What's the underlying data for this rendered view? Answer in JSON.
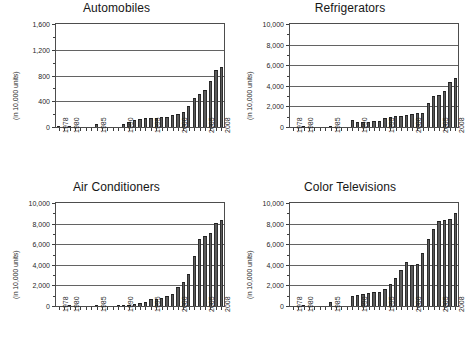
{
  "figure": {
    "panel_count": 4,
    "units_caption": "(in 10,000 units)"
  },
  "chart_data": [
    {
      "type": "bar",
      "title": "Automobiles",
      "xlabel": "",
      "ylabel": "(in 10,000 units)",
      "ylim": [
        0,
        1600
      ],
      "yticks": [
        0,
        400,
        800,
        1200,
        1600
      ],
      "ytick_labels": [
        "0",
        "400",
        "800",
        "1,200",
        "1,600"
      ],
      "grid": true,
      "legend": "none",
      "x": [
        1978,
        1979,
        1980,
        1981,
        1982,
        1983,
        1984,
        1985,
        1986,
        1987,
        1988,
        1989,
        1990,
        1991,
        1992,
        1993,
        1994,
        1995,
        1996,
        1997,
        1998,
        1999,
        2000,
        2001,
        2002,
        2003,
        2004,
        2005,
        2006,
        2007,
        2008
      ],
      "xtick_labels": [
        "1978",
        "1980",
        "1985",
        "1990",
        "1995",
        "2000",
        "2005",
        "2008"
      ],
      "categories": [
        "1978",
        "1979",
        "1980",
        "1981",
        "1982",
        "1983",
        "1984",
        "1985",
        "1986",
        "1987",
        "1988",
        "1989",
        "1990",
        "1991",
        "1992",
        "1993",
        "1994",
        "1995",
        "1996",
        "1997",
        "1998",
        "1999",
        "2000",
        "2001",
        "2002",
        "2003",
        "2004",
        "2005",
        "2006",
        "2007",
        "2008"
      ],
      "values": [
        15,
        0,
        22,
        0,
        0,
        0,
        0,
        44,
        0,
        0,
        0,
        0,
        51,
        71,
        106,
        130,
        137,
        145,
        147,
        158,
        163,
        183,
        207,
        234,
        325,
        444,
        507,
        571,
        718,
        888,
        938
      ]
    },
    {
      "type": "bar",
      "title": "Refrigerators",
      "xlabel": "",
      "ylabel": "(in 10,000 units)",
      "ylim": [
        0,
        10000
      ],
      "yticks": [
        0,
        2000,
        4000,
        6000,
        8000,
        10000
      ],
      "ytick_labels": [
        "0",
        "2,000",
        "4,000",
        "6,000",
        "8,000",
        "10,000"
      ],
      "grid": true,
      "legend": "none",
      "x": [
        1978,
        1979,
        1980,
        1981,
        1982,
        1983,
        1984,
        1985,
        1986,
        1987,
        1988,
        1989,
        1990,
        1991,
        1992,
        1993,
        1994,
        1995,
        1996,
        1997,
        1998,
        1999,
        2000,
        2001,
        2002,
        2003,
        2004,
        2005,
        2006,
        2007,
        2008
      ],
      "xtick_labels": [
        "1978",
        "1980",
        "1985",
        "1990",
        "1995",
        "2000",
        "2005",
        "2008"
      ],
      "categories": [
        "1978",
        "1979",
        "1980",
        "1981",
        "1982",
        "1983",
        "1984",
        "1985",
        "1986",
        "1987",
        "1988",
        "1989",
        "1990",
        "1991",
        "1992",
        "1993",
        "1994",
        "1995",
        "1996",
        "1997",
        "1998",
        "1999",
        "2000",
        "2001",
        "2002",
        "2003",
        "2004",
        "2005",
        "2006",
        "2007",
        "2008"
      ],
      "values": [
        0,
        0,
        5,
        0,
        0,
        0,
        0,
        145,
        0,
        0,
        0,
        670,
        463,
        470,
        485,
        597,
        625,
        918,
        980,
        1045,
        1060,
        1210,
        1279,
        1352,
        1399,
        2299,
        3033,
        3082,
        3530,
        4397,
        4757
      ]
    },
    {
      "type": "bar",
      "title": "Air Conditioners",
      "xlabel": "",
      "ylabel": "(in 10,000 units)",
      "ylim": [
        0,
        10000
      ],
      "yticks": [
        0,
        2000,
        4000,
        6000,
        8000,
        10000
      ],
      "ytick_labels": [
        "0",
        "2,000",
        "4,000",
        "6,000",
        "8,000",
        "10,000"
      ],
      "grid": true,
      "legend": "none",
      "x": [
        1978,
        1979,
        1980,
        1981,
        1982,
        1983,
        1984,
        1985,
        1986,
        1987,
        1988,
        1989,
        1990,
        1991,
        1992,
        1993,
        1994,
        1995,
        1996,
        1997,
        1998,
        1999,
        2000,
        2001,
        2002,
        2003,
        2004,
        2005,
        2006,
        2007,
        2008
      ],
      "xtick_labels": [
        "1978",
        "1980",
        "1985",
        "1990",
        "1995",
        "2000",
        "2005",
        "2008"
      ],
      "categories": [
        "1978",
        "1979",
        "1980",
        "1981",
        "1982",
        "1983",
        "1984",
        "1985",
        "1986",
        "1987",
        "1988",
        "1989",
        "1990",
        "1991",
        "1992",
        "1993",
        "1994",
        "1995",
        "1996",
        "1997",
        "1998",
        "1999",
        "2000",
        "2001",
        "2002",
        "2003",
        "2004",
        "2005",
        "2006",
        "2007",
        "2008"
      ],
      "values": [
        0,
        0,
        2,
        0,
        0,
        0,
        0,
        13,
        0,
        0,
        0,
        22,
        24,
        60,
        160,
        320,
        400,
        682,
        720,
        780,
        970,
        1210,
        1827,
        2344,
        3136,
        4821,
        6461,
        6765,
        7128,
        8065,
        8308
      ]
    },
    {
      "type": "bar",
      "title": "Color Televisions",
      "xlabel": "",
      "ylabel": "(in 10,000 units)",
      "ylim": [
        0,
        10000
      ],
      "yticks": [
        0,
        2000,
        4000,
        6000,
        8000,
        10000
      ],
      "ytick_labels": [
        "0",
        "2,000",
        "4,000",
        "6,000",
        "8,000",
        "10,000"
      ],
      "grid": true,
      "legend": "none",
      "x": [
        1978,
        1979,
        1980,
        1981,
        1982,
        1983,
        1984,
        1985,
        1986,
        1987,
        1988,
        1989,
        1990,
        1991,
        1992,
        1993,
        1994,
        1995,
        1996,
        1997,
        1998,
        1999,
        2000,
        2001,
        2002,
        2003,
        2004,
        2005,
        2006,
        2007,
        2008
      ],
      "xtick_labels": [
        "1978",
        "1980",
        "1985",
        "1990",
        "1995",
        "2000",
        "2005",
        "2008"
      ],
      "categories": [
        "1978",
        "1979",
        "1980",
        "1981",
        "1982",
        "1983",
        "1984",
        "1985",
        "1986",
        "1987",
        "1988",
        "1989",
        "1990",
        "1991",
        "1992",
        "1993",
        "1994",
        "1995",
        "1996",
        "1997",
        "1998",
        "1999",
        "2000",
        "2001",
        "2002",
        "2003",
        "2004",
        "2005",
        "2006",
        "2007",
        "2008"
      ],
      "values": [
        0,
        0,
        3,
        0,
        0,
        0,
        0,
        435,
        0,
        0,
        0,
        940,
        1033,
        1205,
        1275,
        1326,
        1350,
        1682,
        2158,
        2711,
        3502,
        4278,
        3936,
        4094,
        5155,
        6541,
        7433,
        8283,
        8375,
        8478,
        9033
      ]
    }
  ],
  "colors": {
    "bar_fill": "#5b5b5b",
    "bar_edge": "#2e2e2e",
    "axis": "#4d4d4d",
    "gridline": "#636363",
    "text": "#1a1a1a",
    "background": "#ffffff"
  }
}
